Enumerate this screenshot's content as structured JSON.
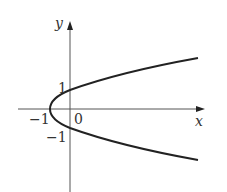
{
  "figure": {
    "x_axis_label": "x",
    "y_axis_label": "y",
    "ticks": {
      "x_neg1": "−1",
      "origin": "0",
      "y_pos1": "1",
      "y_neg1": "−1"
    },
    "colors": {
      "axis": "#555555",
      "curve": "#222222"
    }
  }
}
